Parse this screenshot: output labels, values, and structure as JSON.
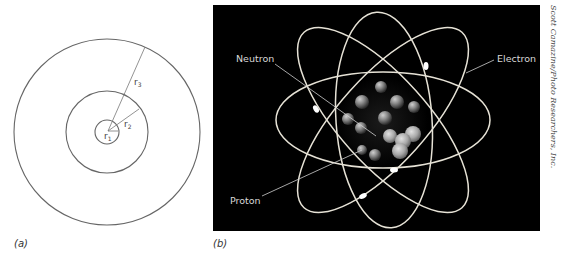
{
  "figure": {
    "panel_a": {
      "label": "(a)",
      "center": [
        107,
        132
      ],
      "circles": [
        {
          "name": "inner",
          "radius": 12
        },
        {
          "name": "middle",
          "radius": 41
        },
        {
          "name": "outer",
          "radius": 93
        }
      ],
      "radius_labels": {
        "r1": "r",
        "r1_sub": "1",
        "r2": "r",
        "r2_sub": "2",
        "r3": "r",
        "r3_sub": "3"
      },
      "line_color": "#666666"
    },
    "panel_b": {
      "label": "(b)",
      "background": "#000000",
      "orbit_color": "#e6e2d6",
      "labels": {
        "neutron": "Neutron",
        "electron": "Electron",
        "proton": "Proton"
      }
    },
    "credit": "Scott Camazine/Photo Researchers, Inc."
  }
}
